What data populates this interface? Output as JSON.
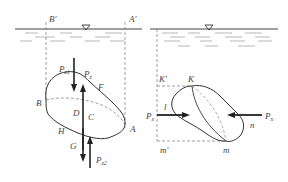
{
  "left_figure": {
    "labels": {
      "B_prime": "B'",
      "A_prime": "A'",
      "P_z1": "P",
      "P_z1_sub": "z1",
      "P_z": "P",
      "P_z_sub": "z",
      "F": "F",
      "B": "B",
      "D": "D",
      "C": "C",
      "A": "A",
      "H": "H",
      "G": "G",
      "P_z2": "P",
      "P_z2_sub": "z2"
    }
  },
  "right_figure": {
    "labels": {
      "K_prime": "K'",
      "K": "K",
      "l": "l",
      "P_x_left": "P",
      "P_x_left_sub": "x",
      "P_x_right": "P",
      "P_x_right_sub": "x",
      "n": "n",
      "m_prime": "m'",
      "m": "m"
    }
  },
  "colors": {
    "line": "#333333",
    "dashed": "#777777",
    "water": "#888888"
  }
}
